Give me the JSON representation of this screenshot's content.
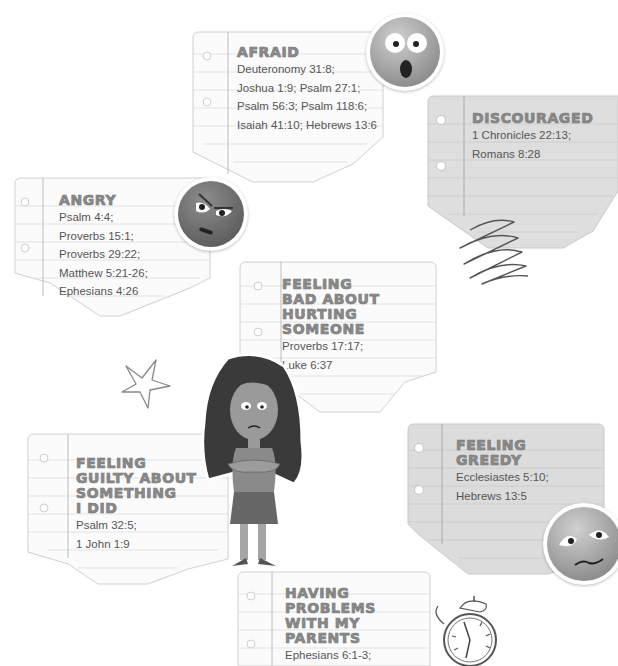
{
  "page": {
    "cards": [
      {
        "id": "afraid",
        "heading": [
          "AFRAID"
        ],
        "refs": [
          "Deuteronomy 31:8;",
          "Joshua 1:9; Psalm 27:1;",
          "Psalm 56:3; Psalm 118:6;",
          "Isaiah 41:10; Hebrews 13:6"
        ]
      },
      {
        "id": "discouraged",
        "heading": [
          "DISCOURAGED"
        ],
        "refs": [
          "1 Chronicles 22:13;",
          "Romans 8:28"
        ]
      },
      {
        "id": "angry",
        "heading": [
          "ANGRY"
        ],
        "refs": [
          "Psalm 4:4;",
          "Proverbs 15:1;",
          "Proverbs 29:22;",
          "Matthew 5:21-26;",
          "Ephesians 4:26"
        ]
      },
      {
        "id": "feeling-bad",
        "heading": [
          "FEELING",
          "BAD ABOUT",
          "HURTING",
          "SOMEONE"
        ],
        "refs": [
          "Proverbs 17:17;",
          "Luke 6:37"
        ]
      },
      {
        "id": "feeling-guilty",
        "heading": [
          "FEELING",
          "GUILTY ABOUT",
          "SOMETHING",
          "I DID"
        ],
        "refs": [
          "Psalm 32:5;",
          "1 John 1:9"
        ]
      },
      {
        "id": "feeling-greedy",
        "heading": [
          "FEELING",
          "GREEDY"
        ],
        "refs": [
          "Ecclesiastes 5:10;",
          "Hebrews 13:5"
        ]
      },
      {
        "id": "parents",
        "heading": [
          "HAVING",
          "PROBLEMS",
          "WITH MY",
          "PARENTS"
        ],
        "refs": [
          "Ephesians 6:1-3;"
        ]
      }
    ],
    "decorations": {
      "emojis": [
        "shocked-face-icon",
        "angry-face-icon",
        "worried-face-icon"
      ],
      "doodles": [
        "star-doodle",
        "scribble-doodle",
        "alarm-clock-doodle"
      ],
      "character": "girl-arms-crossed-illustration"
    },
    "colors": {
      "heading": "#8a8a8a",
      "text": "#555555",
      "paper_white": "#fbfbfb",
      "paper_gray": "#dcdcdc",
      "rule_line": "#d4d4d4",
      "margin_line": "#b5b5b5"
    }
  }
}
